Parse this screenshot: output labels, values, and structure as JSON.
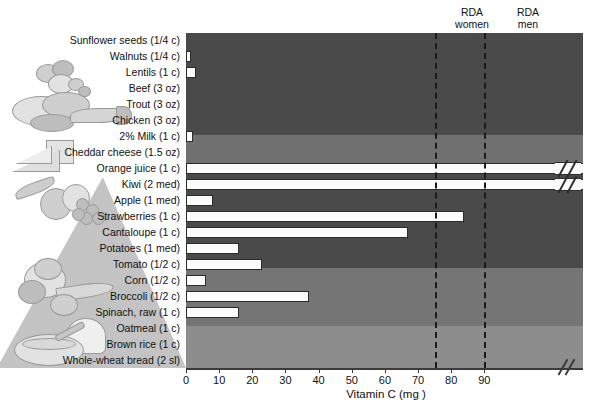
{
  "chart_data": {
    "type": "bar",
    "title": "",
    "xlabel": "Vitamin C (mg )",
    "ylabel": "",
    "orientation": "horizontal",
    "xlim": [
      0,
      120
    ],
    "xticks": [
      0,
      10,
      20,
      30,
      40,
      50,
      60,
      70,
      80,
      90
    ],
    "xtick_labels": [
      "0",
      "10",
      "20",
      "30",
      "40",
      "50",
      "60",
      "70",
      "80",
      "90"
    ],
    "axis_break": true,
    "grid": false,
    "legend": "none",
    "categories": [
      "Sunflower seeds (1/4 c)",
      "Walnuts (1/4 c)",
      "Lentils (1 c)",
      "Beef (3 oz)",
      "Trout (3 oz)",
      "Chicken (3 oz)",
      "2% Milk (1 c)",
      "Cheddar cheese (1.5 oz)",
      "Orange juice (1 c)",
      "Kiwi (2 med)",
      "Apple (1 med)",
      "Strawberries (1 c)",
      "Cantaloupe (1 c)",
      "Potatoes (1 med)",
      "Tomato (1/2 c)",
      "Corn (1/2 c)",
      "Broccoli (1/2 c)",
      "Spinach, raw (1 c)",
      "Oatmeal (1 c)",
      "Brown rice (1 c)",
      "Whole-wheat bread (2 sl)"
    ],
    "values": [
      0,
      1,
      3,
      0,
      0,
      0,
      2,
      0,
      124,
      128,
      8,
      84,
      67,
      16,
      23,
      6,
      37,
      16,
      0,
      0,
      0
    ],
    "overflow_bars": [
      "Orange juice (1 c)",
      "Kiwi (2 med)"
    ],
    "annotations": [
      {
        "label": "RDA women",
        "value": 75
      },
      {
        "label": "RDA men",
        "value": 90
      }
    ],
    "groups": [
      {
        "name": "protein",
        "count": 6,
        "shade": "#4a4a4a"
      },
      {
        "name": "dairy",
        "count": 2,
        "shade": "#707070"
      },
      {
        "name": "fruit",
        "count": 5,
        "shade": "#4a4a4a"
      },
      {
        "name": "vegetables",
        "count": 5,
        "shade": "#757575"
      },
      {
        "name": "grains",
        "count": 3,
        "shade": "#8d8d8d"
      }
    ]
  },
  "axis": {
    "title": "Vitamin C (mg )",
    "ticks": [
      "0",
      "10",
      "20",
      "30",
      "40",
      "50",
      "60",
      "70",
      "80",
      "90"
    ]
  },
  "rda": {
    "women_line1": "RDA",
    "women_line2": "women",
    "men_line1": "RDA",
    "men_line2": "men"
  },
  "labels": {
    "items": [
      "Sunflower seeds (1/4 c)",
      "Walnuts (1/4 c)",
      "Lentils (1 c)",
      "Beef (3 oz)",
      "Trout (3 oz)",
      "Chicken (3 oz)",
      "2% Milk (1 c)",
      "Cheddar cheese (1.5 oz)",
      "Orange juice (1 c)",
      "Kiwi (2 med)",
      "Apple (1 med)",
      "Strawberries (1 c)",
      "Cantaloupe (1 c)",
      "Potatoes (1 med)",
      "Tomato (1/2 c)",
      "Corn (1/2 c)",
      "Broccoli (1/2 c)",
      "Spinach, raw (1 c)",
      "Oatmeal (1 c)",
      "Brown rice (1 c)",
      "Whole-wheat bread (2 sl)"
    ]
  },
  "colors": {
    "band_protein": "#4a4a4a",
    "band_dairy": "#707070",
    "band_fruit": "#4a4a4a",
    "band_vegetables": "#757575",
    "band_grains": "#8d8d8d",
    "bar_fill": "#fbfbfb",
    "bar_stroke": "#2b2b2b",
    "rda_line": "#1b1b1b"
  }
}
